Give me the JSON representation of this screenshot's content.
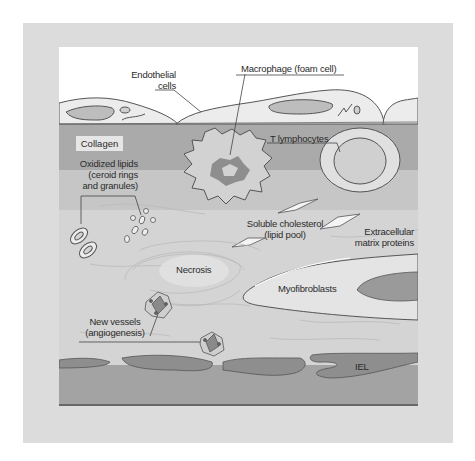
{
  "figure": {
    "type": "atherosclerotic plaque cross-section",
    "colors": {
      "outer_frame": "#dcdcdc",
      "lumen": "#ffffff",
      "endothelium": "#ececec",
      "intima_upper": "#a9a9a9",
      "intima_lower": "#d6d6d6",
      "media": "#9e9e9e",
      "iel": "#8c8c8c",
      "outline": "#555555"
    }
  },
  "labels": {
    "endothelial": "Endothelial",
    "endothelial_2": "cells",
    "macrophage": "Macrophage (foam cell)",
    "collagen": "Collagen",
    "t_lymphocytes": "T lymphocytes",
    "oxidized_1": "Oxidized lipids",
    "oxidized_2": "(ceroid rings",
    "oxidized_3": "and granules)",
    "soluble_1": "Soluble cholesterol",
    "soluble_2": "(lipid pool)",
    "ecm_1": "Extracellular",
    "ecm_2": "matrix proteins",
    "necrosis": "Necrosis",
    "myofibroblasts": "Myofibroblasts",
    "new_vessels_1": "New vessels",
    "new_vessels_2": "(angiogenesis)",
    "iel": "IEL"
  }
}
